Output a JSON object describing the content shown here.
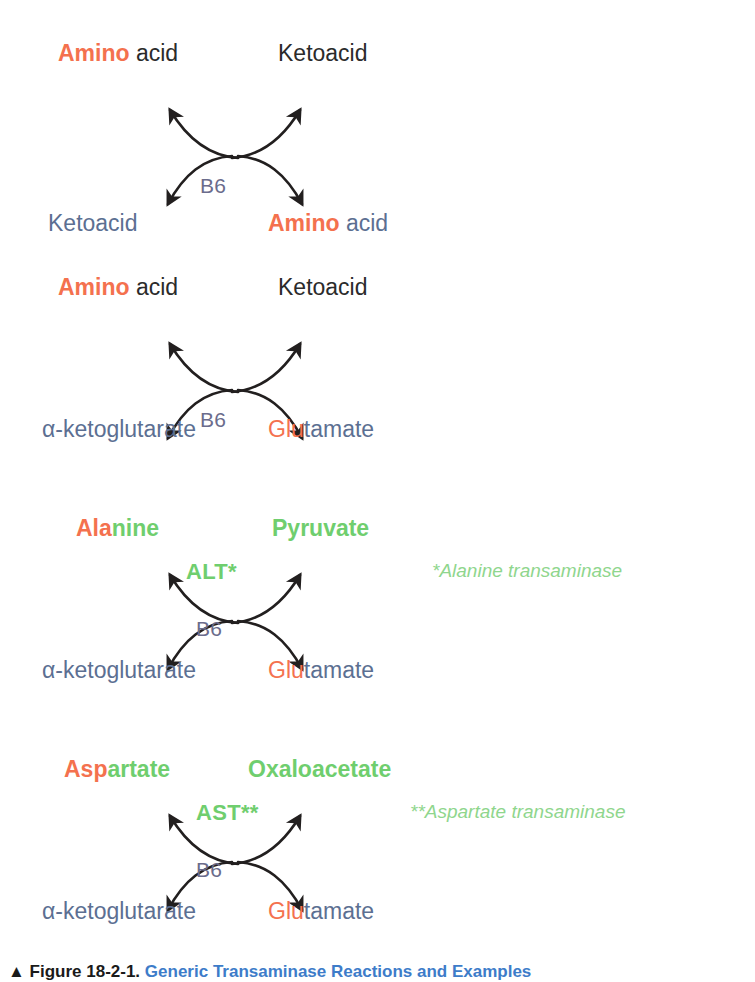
{
  "figure": {
    "title_symbol": "▲",
    "caption_prefix": "Figure 18-2-1.",
    "caption_text": "Generic Transaminase Reactions and Examples"
  },
  "colors": {
    "amino_orange": "#F4714E",
    "dark_text": "#2B2B2B",
    "blue_gray": "#5C6F92",
    "green": "#6FCE6E",
    "green_light": "#8FD68D",
    "slate": "#6B6C8C",
    "arrow": "#221F1F",
    "background": "#FFFFFF"
  },
  "panels": [
    {
      "id": "generic-transamination",
      "top_left": {
        "segments": [
          {
            "text": "Amino",
            "color": "orange",
            "bold": true
          },
          {
            "text": " acid",
            "color": "dark",
            "bold": false
          }
        ]
      },
      "top_right": {
        "segments": [
          {
            "text": "Ketoacid",
            "color": "dark",
            "bold": false
          }
        ]
      },
      "bottom_left": {
        "segments": [
          {
            "text": "Ketoacid",
            "color": "blue",
            "bold": false
          }
        ]
      },
      "bottom_right": {
        "segments": [
          {
            "text": "Amino",
            "color": "orange",
            "bold": true
          },
          {
            "text": " acid",
            "color": "blue",
            "bold": false
          }
        ]
      },
      "cofactor": "B6",
      "enzyme": "",
      "footnote": ""
    },
    {
      "id": "glutamate-transamination",
      "top_left": {
        "segments": [
          {
            "text": "Amino",
            "color": "orange",
            "bold": true
          },
          {
            "text": " acid",
            "color": "dark",
            "bold": false
          }
        ]
      },
      "top_right": {
        "segments": [
          {
            "text": "Ketoacid",
            "color": "dark",
            "bold": false
          }
        ]
      },
      "bottom_left": {
        "segments": [
          {
            "text": "α-ketoglutarate",
            "color": "blue",
            "bold": false
          }
        ]
      },
      "bottom_right": {
        "segments": [
          {
            "text": "Glu",
            "color": "orange",
            "bold": false
          },
          {
            "text": "tamate",
            "color": "blue",
            "bold": false
          }
        ]
      },
      "cofactor": "B6",
      "enzyme": "",
      "footnote": ""
    },
    {
      "id": "alt-reaction",
      "top_left": {
        "segments": [
          {
            "text": "Ala",
            "color": "orange",
            "bold": true
          },
          {
            "text": "nine",
            "color": "green",
            "bold": true
          }
        ]
      },
      "top_right": {
        "segments": [
          {
            "text": "Pyruvate",
            "color": "green",
            "bold": true
          }
        ]
      },
      "bottom_left": {
        "segments": [
          {
            "text": "α-ketoglutarate",
            "color": "blue",
            "bold": false
          }
        ]
      },
      "bottom_right": {
        "segments": [
          {
            "text": "Glu",
            "color": "orange",
            "bold": false
          },
          {
            "text": "tamate",
            "color": "blue",
            "bold": false
          }
        ]
      },
      "cofactor": "B6",
      "enzyme": "ALT*",
      "footnote": "*Alanine transaminase"
    },
    {
      "id": "ast-reaction",
      "top_left": {
        "segments": [
          {
            "text": "Asp",
            "color": "orange",
            "bold": true
          },
          {
            "text": "artate",
            "color": "green",
            "bold": true
          }
        ]
      },
      "top_right": {
        "segments": [
          {
            "text": "Oxaloacetate",
            "color": "green",
            "bold": true
          }
        ]
      },
      "bottom_left": {
        "segments": [
          {
            "text": "α-ketoglutarate",
            "color": "blue",
            "bold": false
          }
        ]
      },
      "bottom_right": {
        "segments": [
          {
            "text": "Glu",
            "color": "orange",
            "bold": false
          },
          {
            "text": "tamate",
            "color": "blue",
            "bold": false
          }
        ]
      },
      "cofactor": "B6",
      "enzyme": "AST**",
      "footnote": "**Aspartate transaminase"
    }
  ]
}
